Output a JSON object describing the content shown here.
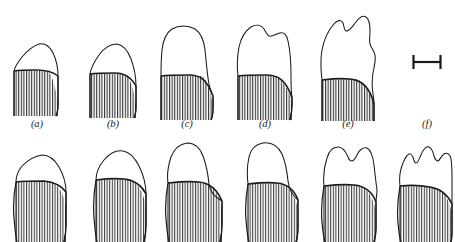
{
  "figure": {
    "kind": "scientific-line-figure",
    "background_color": "#ffffff",
    "outline_color": "#1a1a1a",
    "hatch_color": "#2b2b2b",
    "rows": 2,
    "columns": 6,
    "description_topic": "tooth crown-height series from brachydont to hypsodont"
  },
  "labels": {
    "a": "(a)",
    "b": "(b)",
    "c": "(c)",
    "d": "(d)",
    "e": "(e)",
    "f": "(f)"
  },
  "scale_bar": {
    "name": "scale-bar",
    "orientation": "horizontal",
    "style": "I-beam with end serifs",
    "caption": ""
  },
  "top_row": [
    {
      "id": "a",
      "crown_profile": "low single rounded dome",
      "cusp_count": 1,
      "crown_height_rank": 1,
      "hatched_root": true
    },
    {
      "id": "b",
      "crown_profile": "low asymmetric dome",
      "cusp_count": 1,
      "crown_height_rank": 2,
      "hatched_root": true
    },
    {
      "id": "c",
      "crown_profile": "tall rounded column",
      "cusp_count": 1,
      "crown_height_rank": 3,
      "hatched_root": true
    },
    {
      "id": "d",
      "crown_profile": "tall column with shoulder notch",
      "cusp_count": 2,
      "crown_height_rank": 4,
      "hatched_root": true
    },
    {
      "id": "e",
      "crown_profile": "tall wavy multi-lobed column",
      "cusp_count": 3,
      "crown_height_rank": 5,
      "hatched_root": true
    },
    {
      "id": "f",
      "crown_profile": "scale bar only",
      "cusp_count": 0,
      "crown_height_rank": 0,
      "hatched_root": false
    }
  ],
  "bottom_row": [
    {
      "id": "a2",
      "crown_profile": "low broad dome",
      "cusp_count": 1,
      "crown_height_rank": 1,
      "hatched_root": true
    },
    {
      "id": "b2",
      "crown_profile": "low broad dome, slight shoulder",
      "cusp_count": 1,
      "crown_height_rank": 2,
      "hatched_root": true
    },
    {
      "id": "c2",
      "crown_profile": "tall rounded column on broad root",
      "cusp_count": 1,
      "crown_height_rank": 3,
      "hatched_root": true
    },
    {
      "id": "d2",
      "crown_profile": "tall flat-topped column",
      "cusp_count": 1,
      "crown_height_rank": 4,
      "hatched_root": true
    },
    {
      "id": "e2",
      "crown_profile": "tall bifurcated crown with central notch",
      "cusp_count": 2,
      "crown_height_rank": 5,
      "hatched_root": true
    },
    {
      "id": "f2",
      "crown_profile": "tall wavy multi-lobed crown",
      "cusp_count": 3,
      "crown_height_rank": 6,
      "hatched_root": true
    }
  ]
}
